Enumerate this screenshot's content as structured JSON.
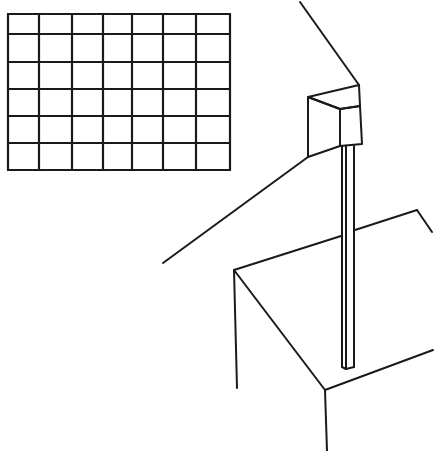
{
  "illustration": {
    "description": "Line drawing: rectangular grid panel, wall-mounted box on a vertical pole, and an open box/table corner",
    "stroke_color": "#1a1a1a",
    "background": "#ffffff",
    "grid": {
      "columns": 7,
      "rows": 6,
      "x_lines": [
        8,
        39,
        72,
        103,
        132,
        163,
        196,
        230
      ],
      "y_lines": [
        14,
        34,
        62,
        89,
        116,
        143,
        170
      ]
    },
    "box_on_pole": {
      "ceiling_line": [
        [
          300,
          2
        ],
        [
          359,
          85
        ]
      ],
      "top_face": [
        [
          308,
          97
        ],
        [
          359,
          85
        ],
        [
          360,
          106
        ],
        [
          340,
          109
        ]
      ],
      "front_face": [
        [
          308,
          97
        ],
        [
          340,
          109
        ],
        [
          340,
          146
        ],
        [
          308,
          157
        ]
      ],
      "side_face": [
        [
          340,
          109
        ],
        [
          360,
          106
        ],
        [
          362,
          144
        ],
        [
          340,
          146
        ]
      ],
      "pole": {
        "x_left": 342,
        "x_mid": 346,
        "x_right": 354,
        "y_top": 146,
        "y_bottom": 367
      },
      "cable_line": [
        [
          163,
          263
        ],
        [
          308,
          157
        ]
      ]
    },
    "table": {
      "back_edge": [
        [
          234,
          270
        ],
        [
          341,
          236
        ]
      ],
      "back_edge_right": [
        [
          355,
          230
        ],
        [
          417,
          210
        ]
      ],
      "right_notch": [
        [
          417,
          210
        ],
        [
          432,
          232
        ]
      ],
      "front_left_edge": [
        [
          234,
          270
        ],
        [
          325,
          390
        ]
      ],
      "front_right_edge": [
        [
          325,
          390
        ],
        [
          433,
          350
        ]
      ],
      "left_leg": [
        [
          234,
          270
        ],
        [
          237,
          388
        ]
      ],
      "front_leg": [
        [
          325,
          390
        ],
        [
          327,
          451
        ]
      ]
    }
  }
}
